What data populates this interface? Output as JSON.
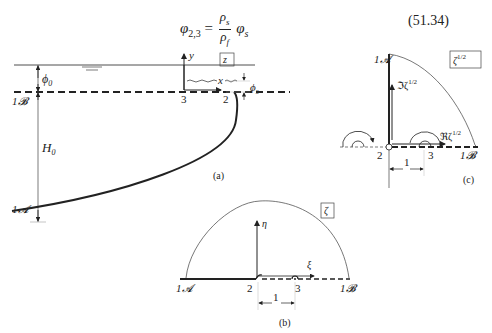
{
  "equation": {
    "lhs": "φ",
    "lhs_sub": "2,3",
    "equals": "=",
    "numerator": "ρ",
    "numerator_sub": "s",
    "denominator": "ρ",
    "denominator_sub": "f",
    "rhs": "φ",
    "rhs_sub": "s",
    "number": "(51.34)"
  },
  "panel_a": {
    "caption": "(a)",
    "plane_label": "z",
    "labels": {
      "phi0": "ϕ",
      "phi0_sub": "0",
      "H0": "H",
      "H0_sub": "0",
      "B": "1𝓑",
      "A": "1𝓐",
      "y": "y",
      "x": "x",
      "phis": "ϕ",
      "phis_sub": "s",
      "pt3": "3",
      "pt2": "2"
    }
  },
  "panel_b": {
    "caption": "(b)",
    "plane_label": "ζ",
    "labels": {
      "eta": "η",
      "xi": "ξ",
      "A": "1𝓐",
      "B": "1𝓑",
      "pt2": "2",
      "pt3": "3",
      "unit": "1"
    }
  },
  "panel_c": {
    "caption": "(c)",
    "plane_label": "ζ",
    "plane_label_sup": "1/2",
    "labels": {
      "im": "ℑζ",
      "im_sup": "1/2",
      "re": "ℜζ",
      "re_sup": "1/2",
      "A": "1𝓐",
      "B": "1𝓑",
      "pt2": "2",
      "pt3": "3",
      "unit": "1"
    }
  }
}
